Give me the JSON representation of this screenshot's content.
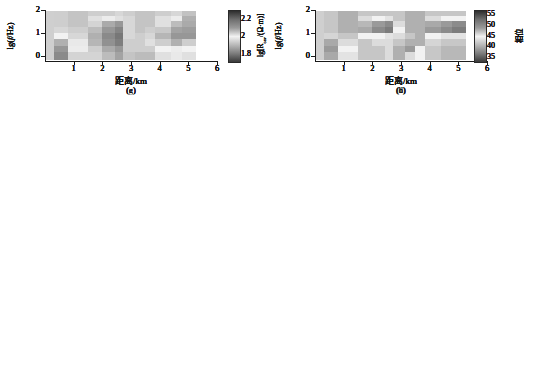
{
  "figure": {
    "type": "multi-panel-pseudosection",
    "rows": 4,
    "cols": 2,
    "background": "#ffffff"
  },
  "axes": {
    "x_title": "距离/km",
    "x_ticks": [
      "1",
      "2",
      "3",
      "4",
      "5",
      "6"
    ],
    "x_tick_values": [
      1,
      2,
      3,
      4,
      5,
      6
    ],
    "x_range": [
      0,
      6
    ],
    "y_title_text": "lg(f/Hz)",
    "y_ticks": [
      "0",
      "1",
      "2"
    ],
    "y_tick_values": [
      0,
      1,
      2
    ],
    "y_range": [
      -0.15,
      2.0
    ]
  },
  "colorbars": {
    "resistivity": {
      "title_text": "lg[Rcav/(Ω·m)]",
      "ticks": [
        "1.8",
        "2",
        "2.2"
      ],
      "tick_values": [
        1.8,
        2.0,
        2.2
      ],
      "range": [
        1.72,
        2.3
      ],
      "stops": [
        "#2e2e2e",
        "#6e6e6e",
        "#9a9a9a",
        "#f2f2f2",
        "#b8b8b8",
        "#7c7c7c",
        "#3a3a3a"
      ]
    },
    "phase": {
      "title_text": "相位",
      "ticks": [
        "55",
        "50",
        "45",
        "40",
        "35"
      ],
      "tick_values": [
        55,
        50,
        45,
        40,
        35
      ],
      "range": [
        33,
        57
      ],
      "stops": [
        "#2e2e2e",
        "#6e6e6e",
        "#9a9a9a",
        "#f2f2f2",
        "#b8b8b8",
        "#7c7c7c",
        "#3a3a3a"
      ]
    }
  },
  "panels": [
    {
      "id": "a",
      "label": "(a)",
      "quantity": "resistivity",
      "row": 0,
      "col": "L"
    },
    {
      "id": "b",
      "label": "(b)",
      "quantity": "phase",
      "row": 0,
      "col": "R"
    },
    {
      "id": "c",
      "label": "(c)",
      "quantity": "resistivity",
      "row": 1,
      "col": "L"
    },
    {
      "id": "d",
      "label": "(d)",
      "quantity": "phase",
      "row": 1,
      "col": "R"
    },
    {
      "id": "e",
      "label": "(e)",
      "quantity": "resistivity",
      "row": 2,
      "col": "L"
    },
    {
      "id": "f",
      "label": "(f)",
      "quantity": "phase",
      "row": 2,
      "col": "R"
    },
    {
      "id": "g",
      "label": "(g)",
      "quantity": "resistivity",
      "row": 3,
      "col": "L"
    },
    {
      "id": "h",
      "label": "(h)",
      "quantity": "phase",
      "row": 3,
      "col": "R"
    }
  ],
  "chart_data": {
    "type": "heatmap",
    "title": "",
    "xlabel": "距离/km",
    "ylabel": "lg(f/Hz)",
    "xlim": [
      0,
      6
    ],
    "ylim": [
      -0.15,
      2.0
    ],
    "grid": false,
    "legend_position": "right-colorbar",
    "x_edges": [
      0.28,
      0.75,
      1.45,
      1.95,
      2.4,
      2.7,
      3.1,
      3.45,
      3.8,
      4.35,
      4.75,
      5.25,
      5.7
    ],
    "y_edges": [
      -0.15,
      0.18,
      0.45,
      0.78,
      1.05,
      1.3,
      1.55,
      1.78,
      2.0
    ],
    "panels": [
      {
        "id": "a",
        "quantity": "lg[Rcav/(Ω·m)]",
        "colorbar": "resistivity",
        "values": [
          [
            2.05,
            2.07,
            2.06,
            2.05,
            2.03,
            2.04,
            2.06,
            2.07,
            2.06,
            2.05,
            2.06,
            2.06
          ],
          [
            2.06,
            2.08,
            2.05,
            2.04,
            2.02,
            2.05,
            2.12,
            2.11,
            2.06,
            2.04,
            2.04,
            2.05
          ],
          [
            2.06,
            2.07,
            2.04,
            1.94,
            1.88,
            2.06,
            2.12,
            2.1,
            2.05,
            1.93,
            1.92,
            1.94
          ],
          [
            2.06,
            2.07,
            1.95,
            1.88,
            1.82,
            2.07,
            2.1,
            2.09,
            1.95,
            1.88,
            1.87,
            1.9
          ],
          [
            2.03,
            2.06,
            1.92,
            1.86,
            1.8,
            2.08,
            2.09,
            2.08,
            1.92,
            1.86,
            1.86,
            1.89
          ],
          [
            1.9,
            2.05,
            1.93,
            1.87,
            1.81,
            2.09,
            2.1,
            2.08,
            1.96,
            1.9,
            1.9,
            1.93
          ],
          [
            1.88,
            2.04,
            1.96,
            1.9,
            1.84,
            2.1,
            2.1,
            1.93,
            2.02,
            2.0,
            2.0,
            2.02
          ],
          [
            1.86,
            1.99,
            1.97,
            1.92,
            1.86,
            2.1,
            1.92,
            1.91,
            2.04,
            2.03,
            2.03,
            2.04
          ]
        ]
      },
      {
        "id": "b",
        "quantity": "相位",
        "colorbar": "phase",
        "values": [
          [
            47,
            48,
            47,
            47,
            46,
            47,
            47,
            48,
            47,
            47,
            47,
            47
          ],
          [
            47,
            48,
            47,
            46,
            45,
            47,
            48,
            48,
            47,
            46,
            46,
            47
          ],
          [
            47,
            48,
            41,
            39,
            37,
            46,
            47,
            48,
            40,
            39,
            38,
            39
          ],
          [
            47,
            48,
            40,
            37,
            35,
            45,
            47,
            48,
            39,
            38,
            37,
            38
          ],
          [
            42,
            47,
            45,
            44,
            43,
            46,
            47,
            48,
            45,
            44,
            44,
            45
          ],
          [
            39,
            45,
            47,
            46,
            45,
            47,
            48,
            48,
            42,
            41,
            41,
            42
          ],
          [
            38,
            44,
            47,
            47,
            46,
            47,
            49,
            44,
            41,
            40,
            40,
            41
          ],
          [
            39,
            43,
            47,
            47,
            46,
            48,
            45,
            44,
            41,
            40,
            40,
            41
          ]
        ]
      },
      {
        "id": "c",
        "quantity": "lg[Rcav/(Ω·m)]",
        "colorbar": "resistivity",
        "values": [
          [
            2.06,
            2.07,
            2.06,
            2.06,
            2.05,
            2.06,
            2.07,
            2.07,
            2.06,
            2.06,
            2.06,
            2.06
          ],
          [
            2.05,
            2.06,
            2.04,
            2.02,
            2.0,
            2.04,
            2.07,
            2.07,
            2.04,
            2.02,
            2.02,
            2.03
          ],
          [
            2.05,
            2.06,
            1.98,
            1.92,
            1.88,
            2.04,
            2.07,
            2.07,
            2.0,
            1.92,
            1.92,
            1.94
          ],
          [
            2.05,
            2.06,
            1.94,
            1.88,
            1.84,
            2.05,
            2.07,
            2.06,
            1.95,
            1.89,
            1.88,
            1.9
          ],
          [
            2.03,
            2.05,
            1.92,
            1.86,
            1.82,
            2.06,
            2.06,
            2.06,
            1.92,
            1.87,
            1.86,
            1.89
          ],
          [
            1.93,
            2.04,
            1.93,
            1.87,
            1.83,
            2.06,
            2.06,
            2.06,
            1.96,
            1.91,
            1.9,
            1.93
          ],
          [
            1.9,
            2.03,
            1.97,
            1.91,
            1.86,
            2.07,
            2.07,
            1.96,
            2.02,
            2.01,
            2.01,
            2.02
          ],
          [
            1.89,
            2.0,
            1.98,
            1.94,
            1.89,
            2.07,
            1.95,
            1.94,
            2.04,
            2.03,
            2.03,
            2.04
          ]
        ]
      },
      {
        "id": "d",
        "quantity": "相位",
        "colorbar": "phase",
        "values": [
          [
            47,
            48,
            47,
            47,
            47,
            47,
            48,
            48,
            47,
            47,
            47,
            47
          ],
          [
            47,
            48,
            46,
            45,
            44,
            47,
            48,
            48,
            46,
            45,
            45,
            46
          ],
          [
            47,
            48,
            41,
            39,
            38,
            46,
            48,
            48,
            41,
            40,
            39,
            40
          ],
          [
            47,
            48,
            40,
            38,
            36,
            45,
            48,
            48,
            40,
            39,
            38,
            39
          ],
          [
            43,
            47,
            45,
            44,
            44,
            46,
            47,
            48,
            45,
            45,
            44,
            45
          ],
          [
            40,
            46,
            47,
            46,
            46,
            47,
            48,
            48,
            43,
            42,
            42,
            43
          ],
          [
            39,
            45,
            47,
            47,
            47,
            48,
            49,
            45,
            42,
            41,
            41,
            42
          ],
          [
            40,
            44,
            47,
            47,
            47,
            48,
            46,
            45,
            42,
            41,
            41,
            42
          ]
        ]
      },
      {
        "id": "e",
        "quantity": "lg[Rcav/(Ω·m)]",
        "colorbar": "resistivity",
        "values": [
          [
            2.05,
            2.06,
            2.05,
            2.04,
            2.03,
            2.04,
            2.05,
            2.06,
            2.05,
            2.04,
            2.05,
            2.05
          ],
          [
            2.05,
            2.07,
            2.04,
            2.02,
            2.0,
            2.04,
            2.07,
            2.07,
            2.04,
            2.02,
            2.02,
            2.03
          ],
          [
            2.05,
            2.06,
            1.97,
            1.9,
            1.87,
            2.04,
            2.07,
            2.06,
            2.0,
            1.94,
            1.92,
            1.96
          ],
          [
            2.04,
            2.05,
            1.93,
            1.87,
            1.84,
            2.04,
            2.06,
            2.05,
            1.96,
            1.9,
            1.88,
            1.93
          ],
          [
            2.01,
            2.04,
            1.91,
            1.86,
            1.83,
            2.04,
            2.05,
            2.04,
            1.93,
            1.88,
            1.87,
            1.92
          ],
          [
            1.91,
            2.02,
            1.92,
            1.87,
            1.84,
            2.04,
            2.05,
            2.03,
            1.97,
            1.92,
            1.91,
            1.95
          ],
          [
            1.87,
            2.0,
            1.96,
            1.91,
            1.88,
            2.05,
            2.05,
            1.97,
            2.01,
            2.0,
            2.0,
            2.02
          ],
          [
            1.84,
            1.96,
            1.97,
            1.93,
            1.9,
            2.05,
            1.94,
            1.95,
            2.03,
            2.02,
            2.02,
            2.03
          ]
        ]
      },
      {
        "id": "f",
        "quantity": "相位",
        "colorbar": "phase",
        "values": [
          [
            47,
            48,
            47,
            47,
            46,
            47,
            47,
            48,
            47,
            47,
            47,
            47
          ],
          [
            47,
            48,
            46,
            45,
            44,
            47,
            48,
            48,
            46,
            45,
            45,
            46
          ],
          [
            47,
            48,
            41,
            39,
            38,
            46,
            47,
            48,
            41,
            39,
            39,
            40
          ],
          [
            47,
            48,
            40,
            38,
            37,
            45,
            47,
            48,
            40,
            38,
            38,
            39
          ],
          [
            42,
            47,
            45,
            44,
            44,
            46,
            47,
            48,
            45,
            44,
            44,
            45
          ],
          [
            39,
            45,
            47,
            46,
            45,
            47,
            48,
            48,
            42,
            41,
            41,
            42
          ],
          [
            38,
            44,
            47,
            47,
            46,
            47,
            49,
            44,
            41,
            40,
            40,
            41
          ],
          [
            39,
            43,
            47,
            47,
            46,
            48,
            45,
            44,
            41,
            40,
            40,
            41
          ]
        ]
      },
      {
        "id": "g",
        "quantity": "lg[Rcav/(Ω·m)]",
        "colorbar": "resistivity",
        "values": [
          [
            2.05,
            2.06,
            2.05,
            2.05,
            2.04,
            2.05,
            2.06,
            2.06,
            2.05,
            2.04,
            1.93,
            1.92
          ],
          [
            2.05,
            2.06,
            2.03,
            2.0,
            1.98,
            2.04,
            2.06,
            2.06,
            2.03,
            2.0,
            1.9,
            1.89
          ],
          [
            2.05,
            2.06,
            1.96,
            1.89,
            1.86,
            2.04,
            2.06,
            2.06,
            1.98,
            1.92,
            1.89,
            1.89
          ],
          [
            2.04,
            2.05,
            1.92,
            1.86,
            1.83,
            2.04,
            2.06,
            2.05,
            1.94,
            1.88,
            1.87,
            1.88
          ],
          [
            2.01,
            2.04,
            1.9,
            1.84,
            1.81,
            2.04,
            2.05,
            2.04,
            1.91,
            1.86,
            1.86,
            1.87
          ],
          [
            1.9,
            2.02,
            1.91,
            1.85,
            1.82,
            2.05,
            2.05,
            2.03,
            1.95,
            1.9,
            1.95,
            1.97
          ],
          [
            1.86,
            2.0,
            1.95,
            1.89,
            1.86,
            2.05,
            2.05,
            1.95,
            2.01,
            2.0,
            2.01,
            2.02
          ],
          [
            1.84,
            1.96,
            1.96,
            1.92,
            1.88,
            2.06,
            1.92,
            1.92,
            2.03,
            2.02,
            2.03,
            2.03
          ]
        ]
      },
      {
        "id": "h",
        "quantity": "相位",
        "colorbar": "phase",
        "values": [
          [
            47,
            48,
            47,
            47,
            47,
            47,
            48,
            48,
            47,
            47,
            47,
            47
          ],
          [
            47,
            48,
            46,
            45,
            44,
            47,
            48,
            48,
            46,
            45,
            45,
            45
          ],
          [
            47,
            48,
            41,
            39,
            38,
            46,
            48,
            48,
            40,
            39,
            38,
            39
          ],
          [
            47,
            48,
            40,
            38,
            37,
            45,
            48,
            48,
            39,
            38,
            37,
            38
          ],
          [
            43,
            47,
            45,
            45,
            44,
            46,
            47,
            48,
            45,
            44,
            44,
            45
          ],
          [
            40,
            46,
            47,
            46,
            46,
            47,
            48,
            48,
            43,
            42,
            42,
            43
          ],
          [
            39,
            45,
            47,
            47,
            46,
            48,
            49,
            45,
            42,
            41,
            41,
            42
          ],
          [
            40,
            44,
            47,
            47,
            46,
            48,
            46,
            45,
            42,
            41,
            41,
            42
          ]
        ]
      }
    ]
  }
}
